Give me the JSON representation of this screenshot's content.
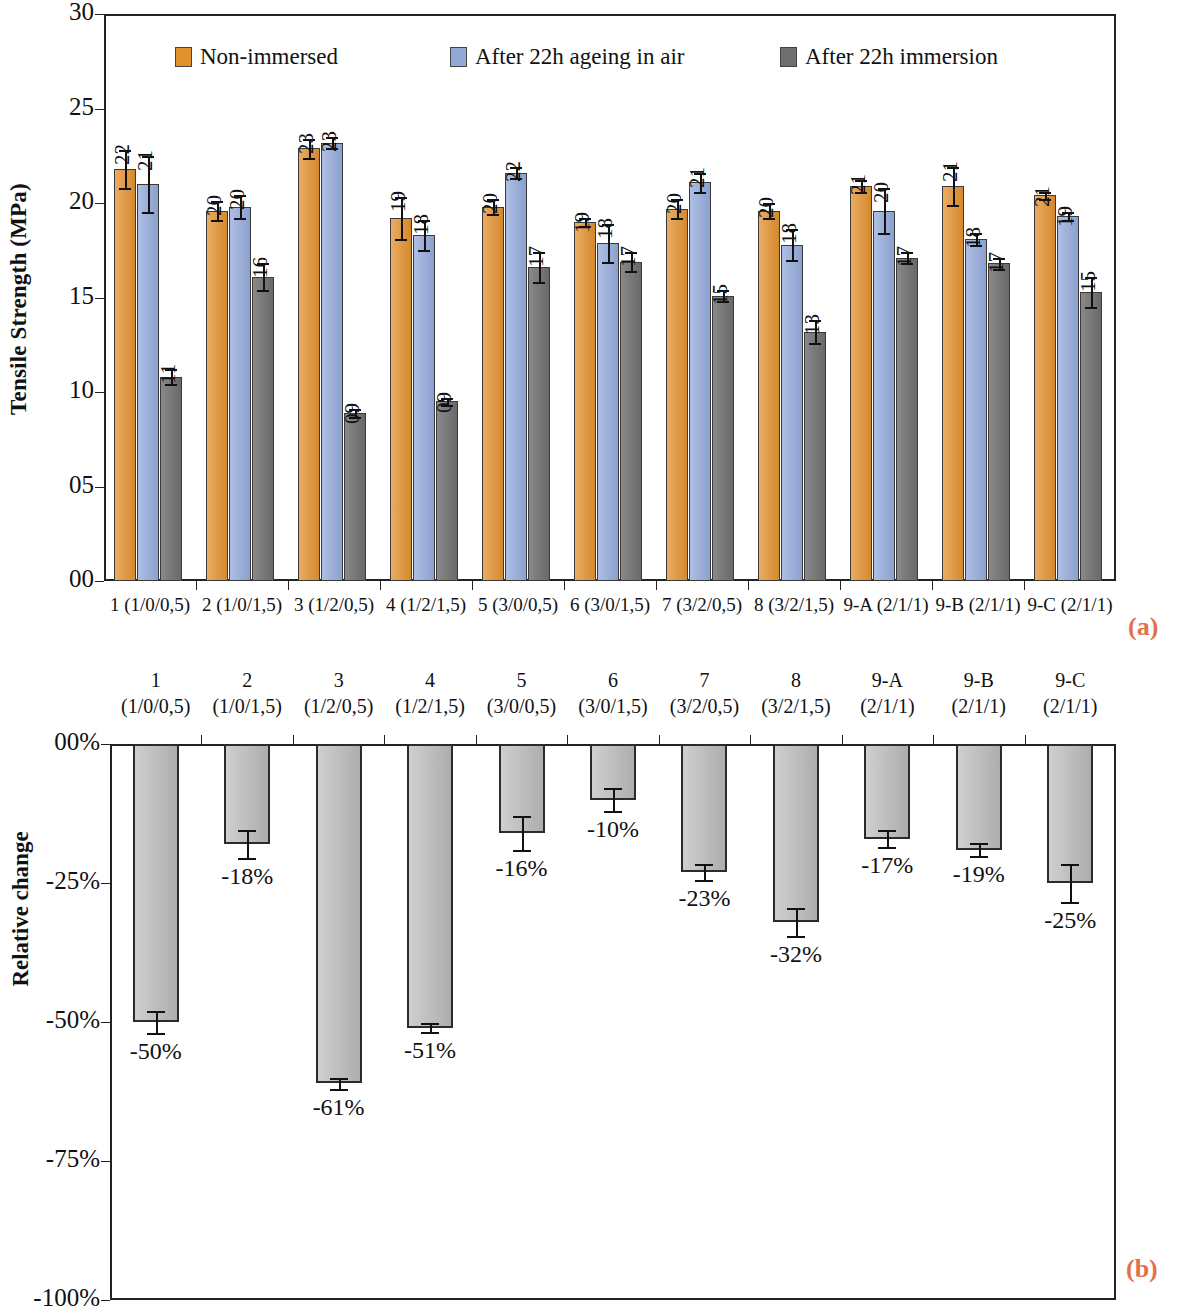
{
  "panels": {
    "a_tag": "(a)",
    "b_tag": "(b)"
  },
  "chart_a": {
    "ylabel": "Tensile Strength (MPa)",
    "yticks": [
      "30",
      "25",
      "20",
      "15",
      "10",
      "05",
      "00"
    ],
    "legend": [
      {
        "label": "Non-immersed",
        "color": "#e2912f"
      },
      {
        "label": "After 22h ageing in air",
        "color": "#92a9d8"
      },
      {
        "label": "After 22h immersion",
        "color": "#6f6f6f"
      }
    ],
    "categories": [
      "1 (1/0/0,5)",
      "2 (1/0/1,5)",
      "3 (1/2/0,5)",
      "4 (1/2/1,5)",
      "5 (3/0/0,5)",
      "6 (3/0/1,5)",
      "7 (3/2/0,5)",
      "8 (3/2/1,5)",
      "9-A (2/1/1)",
      "9-B (2/1/1)",
      "9-C (2/1/1)"
    ],
    "labels": {
      "s0": [
        "22",
        "20",
        "23",
        "19",
        "20",
        "19",
        "20",
        "20",
        "21",
        "21",
        "21"
      ],
      "s1": [
        "21",
        "20",
        "23",
        "18",
        "22",
        "18",
        "21",
        "18",
        "20",
        "18",
        "19"
      ],
      "s2": [
        "11",
        "16",
        "09",
        "09",
        "17",
        "17",
        "15",
        "13",
        "17",
        "17",
        "15"
      ]
    }
  },
  "chart_b": {
    "ylabel": "Relative change",
    "yticks": [
      "00%",
      "-25%",
      "-50%",
      "-75%",
      "-100%"
    ],
    "categories_line1": [
      "1",
      "2",
      "3",
      "4",
      "5",
      "6",
      "7",
      "8",
      "9-A",
      "9-B",
      "9-C"
    ],
    "categories_line2": [
      "(1/0/0,5)",
      "(1/0/1,5)",
      "(1/2/0,5)",
      "(1/2/1,5)",
      "(3/0/0,5)",
      "(3/0/1,5)",
      "(3/2/0,5)",
      "(3/2/1,5)",
      "(2/1/1)",
      "(2/1/1)",
      "(2/1/1)"
    ],
    "labels": [
      "-50%",
      "-18%",
      "-61%",
      "-51%",
      "-16%",
      "-10%",
      "-23%",
      "-32%",
      "-17%",
      "-19%",
      "-25%"
    ]
  },
  "chart_data": [
    {
      "type": "bar",
      "title": "",
      "panel": "(a)",
      "xlabel": "",
      "ylabel": "Tensile Strength (MPa)",
      "ylim": [
        0,
        30
      ],
      "yticks": [
        0,
        5,
        10,
        15,
        20,
        25,
        30
      ],
      "ytick_labels": [
        "00",
        "05",
        "10",
        "15",
        "20",
        "25",
        "30"
      ],
      "grid": false,
      "legend_position": "top-inside",
      "categories": [
        "1 (1/0/0,5)",
        "2 (1/0/1,5)",
        "3 (1/2/0,5)",
        "4 (1/2/1,5)",
        "5 (3/0/0,5)",
        "6 (3/0/1,5)",
        "7 (3/2/0,5)",
        "8 (3/2/1,5)",
        "9-A (2/1/1)",
        "9-B (2/1/1)",
        "9-C (2/1/1)"
      ],
      "series": [
        {
          "name": "Non-immersed",
          "color": "#e2912f",
          "values": [
            21.8,
            19.6,
            22.9,
            19.2,
            19.8,
            19.0,
            19.7,
            19.6,
            20.9,
            20.9,
            20.4
          ],
          "data_labels": [
            "22",
            "20",
            "23",
            "19",
            "20",
            "19",
            "20",
            "20",
            "21",
            "21",
            "21"
          ],
          "errors": [
            1.0,
            0.5,
            0.5,
            1.1,
            0.4,
            0.2,
            0.5,
            0.4,
            0.3,
            1.0,
            0.2
          ]
        },
        {
          "name": "After 22h ageing in air",
          "color": "#92a9d8",
          "values": [
            21.0,
            19.8,
            23.2,
            18.3,
            21.6,
            17.9,
            21.1,
            17.8,
            19.6,
            18.1,
            19.3
          ],
          "data_labels": [
            "21",
            "20",
            "23",
            "18",
            "22",
            "18",
            "21",
            "18",
            "20",
            "18",
            "19"
          ],
          "errors": [
            1.5,
            0.6,
            0.3,
            0.8,
            0.3,
            1.0,
            0.5,
            0.8,
            1.2,
            0.3,
            0.2
          ]
        },
        {
          "name": "After 22h immersion",
          "color": "#6f6f6f",
          "values": [
            10.8,
            16.1,
            8.9,
            9.5,
            16.6,
            16.9,
            15.1,
            13.2,
            17.1,
            16.8,
            15.3
          ],
          "data_labels": [
            "11",
            "16",
            "09",
            "09",
            "17",
            "17",
            "15",
            "13",
            "17",
            "17",
            "15"
          ],
          "errors": [
            0.4,
            0.7,
            0.2,
            0.2,
            0.8,
            0.5,
            0.3,
            0.6,
            0.3,
            0.3,
            0.8
          ]
        }
      ]
    },
    {
      "type": "bar",
      "title": "",
      "panel": "(b)",
      "xlabel": "",
      "ylabel": "Relative change",
      "ylim": [
        -100,
        0
      ],
      "yticks": [
        0,
        -25,
        -50,
        -75,
        -100
      ],
      "ytick_labels": [
        "00%",
        "-25%",
        "-50%",
        "-75%",
        "-100%"
      ],
      "grid": false,
      "legend_position": "none",
      "categories": [
        "1 (1/0/0,5)",
        "2 (1/0/1,5)",
        "3 (1/2/0,5)",
        "4 (1/2/1,5)",
        "5 (3/0/0,5)",
        "6 (3/0/1,5)",
        "7 (3/2/0,5)",
        "8 (3/2/1,5)",
        "9-A (2/1/1)",
        "9-B (2/1/1)",
        "9-C (2/1/1)"
      ],
      "series": [
        {
          "name": "Relative change after 22h immersion",
          "color": "#b6b6b6",
          "values": [
            -50,
            -18,
            -61,
            -51,
            -16,
            -10,
            -23,
            -32,
            -17,
            -19,
            -25
          ],
          "data_labels": [
            "-50%",
            "-18%",
            "-61%",
            "-51%",
            "-16%",
            "-10%",
            "-23%",
            "-32%",
            "-17%",
            "-19%",
            "-25%"
          ],
          "errors": [
            2.0,
            2.5,
            1.0,
            0.8,
            3.0,
            2.0,
            1.5,
            2.5,
            1.5,
            1.2,
            3.5
          ]
        }
      ]
    }
  ]
}
